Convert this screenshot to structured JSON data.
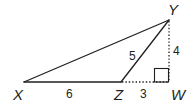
{
  "diagram": {
    "type": "geometry-triangle",
    "vertices": {
      "X": {
        "label": "X",
        "x": 24,
        "y": 82
      },
      "Y": {
        "label": "Y",
        "x": 169,
        "y": 20
      },
      "Z": {
        "label": "Z",
        "x": 121,
        "y": 82
      },
      "W": {
        "label": "W",
        "x": 169,
        "y": 82
      }
    },
    "segments": [
      {
        "from": "X",
        "to": "Y",
        "style": "solid",
        "length_label": ""
      },
      {
        "from": "X",
        "to": "Z",
        "style": "solid",
        "length_label": "6"
      },
      {
        "from": "Z",
        "to": "Y",
        "style": "solid",
        "length_label": "5"
      },
      {
        "from": "Z",
        "to": "W",
        "style": "dotted",
        "length_label": "3"
      },
      {
        "from": "Y",
        "to": "W",
        "style": "dotted",
        "length_label": "4"
      }
    ],
    "right_angle_at": "W",
    "labels": {
      "X": "X",
      "Y": "Y",
      "Z": "Z",
      "W": "W",
      "XZ": "6",
      "ZY": "5",
      "ZW": "3",
      "YW": "4"
    },
    "colors": {
      "stroke": "#231f20",
      "background": "#ffffff"
    }
  }
}
